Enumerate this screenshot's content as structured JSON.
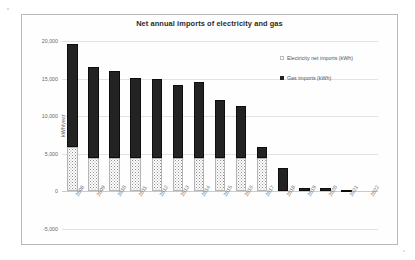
{
  "chart_data": {
    "type": "bar",
    "subtype": "stacked-column",
    "title": "Net annual imports of electricity and gas",
    "xlabel": "",
    "ylabel": "kWh/year",
    "ylim": [
      -5000,
      20000
    ],
    "yticks": [
      20000,
      15000,
      10000,
      5000,
      0,
      -5000
    ],
    "ytick_labels": [
      "20,000",
      "15,000",
      "10,000",
      "5,000",
      "0",
      "-5,000"
    ],
    "grid": true,
    "legend_position": "right-top",
    "categories": [
      "2008",
      "2009",
      "2010",
      "2011",
      "2012",
      "2013",
      "2014",
      "2015",
      "2016",
      "2017",
      "2018",
      "2019",
      "2020",
      "2021",
      "2022"
    ],
    "series": [
      {
        "name": "Electricity net imports (kWh)",
        "color": "#ffffff",
        "fill": "dotted-pattern",
        "values": [
          5900,
          4500,
          4500,
          4500,
          4500,
          4500,
          4500,
          4500,
          4500,
          4500,
          0,
          0,
          0,
          0,
          0
        ]
      },
      {
        "name": "Gas imports (kWh)",
        "color": "#232323",
        "fill": "solid",
        "values": [
          13700,
          12000,
          11500,
          10600,
          10500,
          9700,
          10100,
          7700,
          6900,
          1400,
          3100,
          450,
          450,
          150,
          0
        ]
      }
    ],
    "totals": [
      19600,
      16500,
      16000,
      15100,
      15000,
      14200,
      14600,
      12200,
      11400,
      5900,
      3100,
      450,
      450,
      150,
      0
    ]
  },
  "legend": {
    "items": [
      {
        "label": "Electricity net imports (kWh)",
        "swatch": "dotted-swatch"
      },
      {
        "label": "Gas imports (kWh)",
        "swatch": "solid-dark-swatch"
      }
    ]
  }
}
